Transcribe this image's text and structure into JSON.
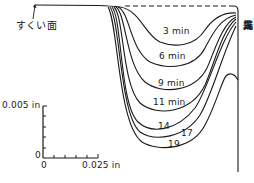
{
  "figure": {
    "rake_face_label": "すくい面",
    "tool_tip_label": [
      "工",
      "具",
      "先",
      "端"
    ],
    "scale": {
      "vertical_label": "0.005 in",
      "origin_label_y": "0",
      "origin_label_x": "0",
      "horizontal_label": "0.025 in"
    },
    "curve_labels": [
      {
        "id": "t3",
        "text": "3 min"
      },
      {
        "id": "t6",
        "text": "6 min"
      },
      {
        "id": "t9",
        "text": "9 min"
      },
      {
        "id": "t11",
        "text": "11 min"
      },
      {
        "id": "t14",
        "text": "14"
      },
      {
        "id": "t17",
        "text": "17"
      },
      {
        "id": "t19",
        "text": "19"
      }
    ],
    "line_color": "#1a1a1a"
  }
}
